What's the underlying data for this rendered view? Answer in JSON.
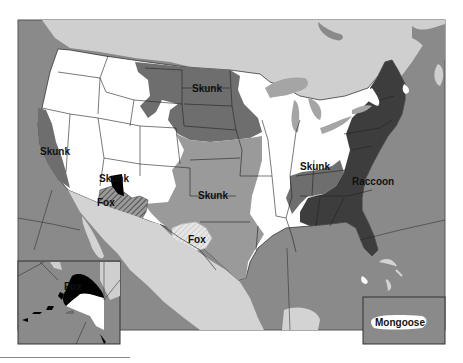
{
  "map": {
    "type": "choropleth",
    "region": "United States, Mexico and southern Canada with Alaska and Puerto Rico insets",
    "legend_shown": false,
    "colors": {
      "canada_land": "#cfcfcf",
      "ocean": "#8a8a8a",
      "mexico_land": "#d3d3d3",
      "no_reservoir_white": "#ffffff",
      "skunk_north_central": "#6e6e6e",
      "skunk_south_central": "#9a9a9a",
      "raccoon": "#3d3d3d",
      "fox_alaska": "#000000",
      "fox_arizona_hatch": "#555555",
      "fox_texas_hatch": "#dcdcdc",
      "lakes": "#a5a5a5",
      "state_border": "#222222"
    },
    "labels": {
      "skunk_california": "Skunk",
      "skunk_north_central": "Skunk",
      "skunk_arizona": "Skunk",
      "fox_arizona": "Fox",
      "skunk_south_central": "Skunk",
      "fox_texas": "Fox",
      "skunk_kentucky": "Skunk",
      "raccoon_east": "Raccoon",
      "fox_alaska": "Fox",
      "mongoose_puerto_rico": "Mongoose"
    },
    "insets": [
      {
        "name": "Alaska",
        "label": "Fox"
      },
      {
        "name": "Puerto Rico",
        "label": "Mongoose"
      }
    ]
  }
}
